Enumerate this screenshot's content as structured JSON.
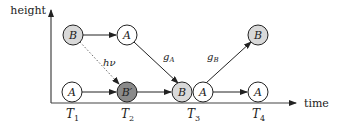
{
  "axes": {
    "y_label": "height",
    "x_label": "time",
    "ticks": [
      {
        "name": "T",
        "sub": "1"
      },
      {
        "name": "T",
        "sub": "2"
      },
      {
        "name": "T",
        "sub": "3"
      },
      {
        "name": "T",
        "sub": "4"
      }
    ]
  },
  "nodes": {
    "upper_b": {
      "label": "B",
      "fill": "#d9d9d9"
    },
    "upper_a": {
      "label": "A",
      "fill": "#ffffff"
    },
    "upper_b_right": {
      "label": "B",
      "fill": "#d9d9d9"
    },
    "lower_a1": {
      "label": "A",
      "fill": "#ffffff"
    },
    "lower_bprime": {
      "label": "B′",
      "fill": "#8a8a8a"
    },
    "lower_b": {
      "label": "B",
      "fill": "#d9d9d9"
    },
    "lower_a3": {
      "label": "A",
      "fill": "#ffffff"
    },
    "lower_a4": {
      "label": "A",
      "fill": "#ffffff"
    }
  },
  "edge_labels": {
    "photon": {
      "main": "hν"
    },
    "ga": {
      "main": "g",
      "sub": "A"
    },
    "gb": {
      "main": "g",
      "sub": "B"
    }
  }
}
